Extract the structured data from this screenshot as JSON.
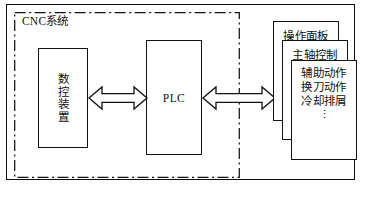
{
  "diagram": {
    "title_label": "CNC系统",
    "blocks": [
      {
        "id": "cnc-device",
        "label": "数控装置",
        "orientation": "vertical"
      },
      {
        "id": "plc",
        "label": "PLC",
        "orientation": "horizontal"
      }
    ],
    "connectors": [
      {
        "id": "cnc-device-to-plc",
        "type": "double-headed-block-arrow"
      },
      {
        "id": "plc-to-functions",
        "type": "double-headed-block-arrow"
      }
    ],
    "cards": [
      {
        "id": "operation-panel",
        "lines": [
          "操作面板"
        ],
        "ellipsis": ""
      },
      {
        "id": "spindle-control",
        "lines": [
          "主轴控制"
        ],
        "ellipsis": ""
      },
      {
        "id": "auxiliary-actions",
        "lines": [
          "辅助动作",
          "换刀动作",
          "冷却排屑"
        ],
        "ellipsis": "⋮"
      }
    ],
    "boundary": {
      "style": "dash-dot",
      "label": "CNC系统"
    },
    "colors": {
      "stroke": "#111111",
      "background": "#ffffff",
      "text": "#121212"
    }
  }
}
